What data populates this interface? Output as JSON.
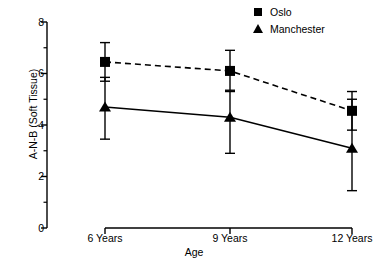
{
  "chart_data": {
    "type": "line",
    "title": "",
    "xlabel": "Age",
    "ylabel": "A-N-B (Soft Tissue)",
    "categories": [
      "6 Years",
      "9 Years",
      "12 Years"
    ],
    "x": [
      6,
      9,
      12
    ],
    "ylim": [
      0,
      8
    ],
    "yticks": [
      0,
      2,
      4,
      6,
      8
    ],
    "ytick_labels": [
      "0",
      "2",
      "4",
      "6",
      "8"
    ],
    "yminor_ticks": [
      1,
      3,
      5,
      7
    ],
    "grid": false,
    "legend_position": "top-right",
    "error_bar_type": "standard deviation",
    "series": [
      {
        "name": "Oslo",
        "marker": "square",
        "linestyle": "dashed",
        "color": "#000000",
        "values": [
          6.45,
          6.1,
          4.55
        ],
        "err_low": [
          5.7,
          5.35,
          3.8
        ],
        "err_high": [
          7.2,
          6.9,
          5.3
        ]
      },
      {
        "name": "Manchester",
        "marker": "triangle",
        "linestyle": "solid",
        "color": "#000000",
        "values": [
          4.7,
          4.3,
          3.1
        ],
        "err_low": [
          3.45,
          2.9,
          1.45
        ],
        "err_high": [
          5.85,
          5.3,
          5.0
        ]
      }
    ]
  },
  "legend": {
    "items": [
      {
        "label": "Oslo",
        "marker": "square"
      },
      {
        "label": "Manchester",
        "marker": "triangle"
      }
    ]
  },
  "axes": {
    "y_title": "A-N-B (Soft Tissue)",
    "x_title": "Age"
  }
}
